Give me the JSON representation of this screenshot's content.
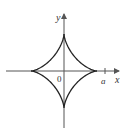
{
  "figure": {
    "type": "astroid",
    "axis_labels": {
      "x": "x",
      "y": "y"
    },
    "origin_label": "0",
    "tick_label": "a",
    "colors": {
      "curve": "#222222",
      "axis": "#555555",
      "text": "#333333"
    }
  }
}
